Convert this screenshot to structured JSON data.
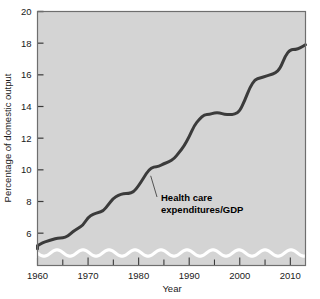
{
  "chart_data": {
    "type": "line",
    "title": "",
    "xlabel": "Year",
    "ylabel": "Percentage of domestic output",
    "xlim": [
      1960,
      2013
    ],
    "ylim": [
      5,
      20
    ],
    "y_axis_broken": true,
    "y_break_note": "wavy break below 5",
    "grid": false,
    "legend": "none",
    "background": "#d4d4d4",
    "line_color": "#3b3b3b",
    "xticks": [
      1960,
      1970,
      1980,
      1990,
      2000,
      2010
    ],
    "xtick_labels": [
      "1960",
      "1970",
      "1980",
      "1990",
      "2000",
      "2010"
    ],
    "xminor_step": 5,
    "yticks": [
      6,
      8,
      10,
      12,
      14,
      16,
      18,
      20
    ],
    "ytick_labels": [
      "6",
      "8",
      "10",
      "12",
      "14",
      "16",
      "18",
      "20"
    ],
    "series": [
      {
        "name": "Health care expenditures/GDP",
        "x": [
          1960,
          1961,
          1962,
          1963,
          1964,
          1965,
          1966,
          1967,
          1968,
          1969,
          1970,
          1971,
          1972,
          1973,
          1974,
          1975,
          1976,
          1977,
          1978,
          1979,
          1980,
          1981,
          1982,
          1983,
          1984,
          1985,
          1986,
          1987,
          1988,
          1989,
          1990,
          1991,
          1992,
          1993,
          1994,
          1995,
          1996,
          1997,
          1998,
          1999,
          2000,
          2001,
          2002,
          2003,
          2004,
          2005,
          2006,
          2007,
          2008,
          2009,
          2010,
          2011,
          2012,
          2013
        ],
        "values": [
          5.2,
          5.4,
          5.5,
          5.6,
          5.7,
          5.7,
          5.8,
          6.1,
          6.3,
          6.5,
          7.0,
          7.2,
          7.3,
          7.4,
          7.8,
          8.2,
          8.4,
          8.5,
          8.5,
          8.6,
          9.0,
          9.5,
          10.0,
          10.2,
          10.2,
          10.4,
          10.5,
          10.7,
          11.1,
          11.5,
          12.1,
          12.8,
          13.2,
          13.5,
          13.5,
          13.6,
          13.6,
          13.5,
          13.5,
          13.5,
          13.7,
          14.4,
          15.2,
          15.7,
          15.8,
          15.9,
          16.0,
          16.1,
          16.4,
          17.2,
          17.6,
          17.6,
          17.7,
          17.9
        ],
        "color": "#3b3b3b",
        "width": 3
      }
    ],
    "annotations": [
      {
        "text_lines": [
          "Health care",
          "expenditures/GDP"
        ],
        "points_to_year": 1982,
        "points_to_value": 10.0
      }
    ]
  },
  "annotation": {
    "line1": "Health care",
    "line2": "expenditures/GDP"
  },
  "axes": {
    "y_title": "Percentage of domestic output",
    "x_title": "Year"
  }
}
